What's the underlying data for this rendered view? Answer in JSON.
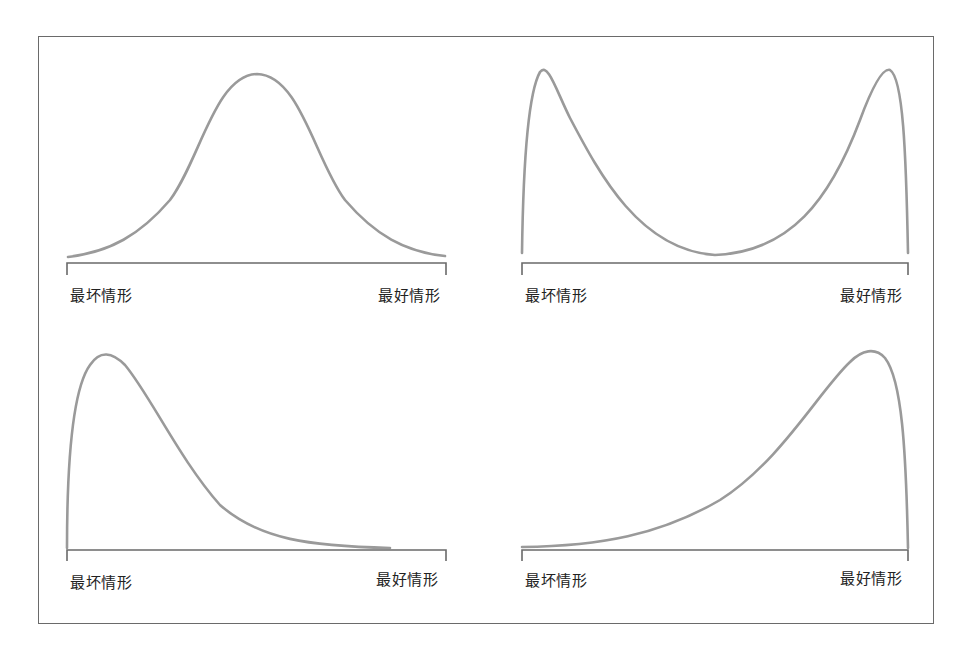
{
  "figure": {
    "panels": [
      {
        "id": "normal",
        "left_label": "最坏情形",
        "right_label": "最好情形"
      },
      {
        "id": "bimodal",
        "left_label": "最坏情形",
        "right_label": "最好情形"
      },
      {
        "id": "right-skewed",
        "left_label": "最坏情形",
        "right_label": "最好情形"
      },
      {
        "id": "left-skewed",
        "left_label": "最坏情形",
        "right_label": "最好情形"
      }
    ],
    "colors": {
      "curve": "#9a9a9a",
      "axis": "#6a6a6a",
      "frame": "#6a6a6a",
      "text": "#222222"
    }
  }
}
